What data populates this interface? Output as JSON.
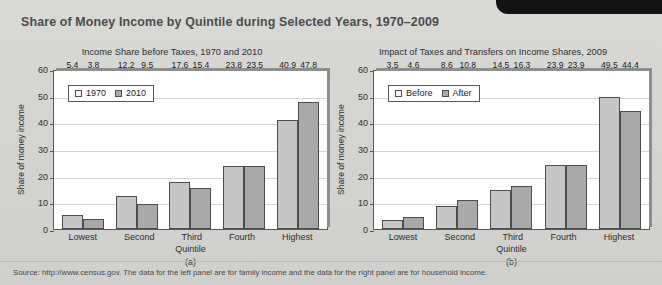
{
  "exhibit_tab": {
    "label": "EXHIBIT"
  },
  "page_title": "Share of Money Income by Quintile during Selected Years, 1970–2009",
  "source_note": "Source: http://www.census.gov. The data for the left panel are for family income and the data for the right panel are for household income.",
  "panels": [
    {
      "letter": "(a)",
      "title": "Income Share before Taxes, 1970 and 2010",
      "ylabel": "Share of money income",
      "xlabel": "Quintile",
      "legend": [
        "1970",
        "2010"
      ]
    },
    {
      "letter": "(b)",
      "title": "Impact of Taxes and Transfers on Income Shares, 2009",
      "ylabel": "Share of money income",
      "xlabel": "Quintile",
      "legend": [
        "Before",
        "After"
      ]
    }
  ],
  "yticks": [
    "60",
    "50",
    "40",
    "30",
    "20",
    "10",
    "0"
  ],
  "chart_data": [
    {
      "type": "bar",
      "title": "Income Share before Taxes, 1970 and 2010",
      "panel": "(a)",
      "categories": [
        "Lowest",
        "Second",
        "Third",
        "Fourth",
        "Highest"
      ],
      "series": [
        {
          "name": "1970",
          "values": [
            5.4,
            12.2,
            17.6,
            23.8,
            40.9
          ]
        },
        {
          "name": "2010",
          "values": [
            3.8,
            9.5,
            15.4,
            23.5,
            47.8
          ]
        }
      ],
      "xlabel": "Quintile",
      "ylabel": "Share of money income",
      "ylim": [
        0,
        60
      ],
      "yticks": [
        0,
        10,
        20,
        30,
        40,
        50,
        60
      ],
      "grid": true,
      "legend_position": "top-left",
      "colors": {
        "1970": "#c6c6c6",
        "2010": "#a9a9a9"
      }
    },
    {
      "type": "bar",
      "title": "Impact of Taxes and Transfers on Income Shares, 2009",
      "panel": "(b)",
      "categories": [
        "Lowest",
        "Second",
        "Third",
        "Fourth",
        "Highest"
      ],
      "series": [
        {
          "name": "Before",
          "values": [
            3.5,
            8.6,
            14.5,
            23.9,
            49.5
          ]
        },
        {
          "name": "After",
          "values": [
            4.6,
            10.8,
            16.3,
            23.9,
            44.4
          ]
        }
      ],
      "xlabel": "Quintile",
      "ylabel": "Share of money income",
      "ylim": [
        0,
        60
      ],
      "yticks": [
        0,
        10,
        20,
        30,
        40,
        50,
        60
      ],
      "grid": true,
      "legend_position": "top-left",
      "colors": {
        "Before": "#c6c6c6",
        "After": "#a9a9a9"
      }
    }
  ]
}
